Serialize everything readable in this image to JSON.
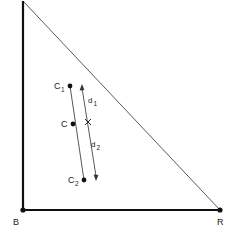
{
  "figure": {
    "title": "",
    "background_color": "#ffffff",
    "stroke_color": "#111111",
    "hypotenuse_color": "#555555",
    "canvas": {
      "width": 238,
      "height": 241
    }
  },
  "triangle": {
    "apex": {
      "x": 23,
      "y": 1
    },
    "vertex_b": {
      "x": 23,
      "y": 210
    },
    "vertex_r": {
      "x": 220,
      "y": 210
    },
    "labels": {
      "b": "B",
      "r": "R"
    },
    "label_positions": {
      "b": {
        "x": 13,
        "y": 224
      },
      "r": {
        "x": 218,
        "y": 224
      }
    }
  },
  "points": [
    {
      "id": "c1",
      "label": "C",
      "subscript": "1",
      "x": 70,
      "y": 86,
      "label_x": 55,
      "label_y": 89,
      "sub_x": 62,
      "sub_y": 92
    },
    {
      "id": "c",
      "label": "C",
      "subscript": "",
      "x": 73,
      "y": 124,
      "label_x": 62,
      "label_y": 127,
      "sub_x": 0,
      "sub_y": 0
    },
    {
      "id": "c2",
      "label": "C",
      "subscript": "2",
      "x": 84,
      "y": 180,
      "label_x": 69,
      "label_y": 183,
      "sub_x": 76,
      "sub_y": 186
    }
  ],
  "segments": {
    "chord": {
      "x1": 70,
      "y1": 86,
      "x2": 84,
      "y2": 180,
      "description": "line through C1, C and C2"
    },
    "arrow_line": {
      "x1": 82,
      "y1": 85,
      "x2": 96,
      "y2": 179,
      "description": "double headed arrow parallel to chord"
    }
  },
  "cross_mark": {
    "x": 88,
    "y": 122,
    "size": 4,
    "label": "x"
  },
  "distances": [
    {
      "id": "d1",
      "label": "d",
      "subscript": "1",
      "label_x": 88,
      "label_y": 103,
      "sub_x": 94,
      "sub_y": 106
    },
    {
      "id": "d2",
      "label": "d",
      "subscript": "2",
      "label_x": 91,
      "label_y": 146,
      "sub_x": 97,
      "sub_y": 149
    }
  ],
  "arrowheads": [
    {
      "id": "arrowhead-top",
      "x": 82,
      "y": 85,
      "direction": "up"
    },
    {
      "id": "arrowhead-bottom",
      "x": 96,
      "y": 179,
      "direction": "down"
    }
  ]
}
